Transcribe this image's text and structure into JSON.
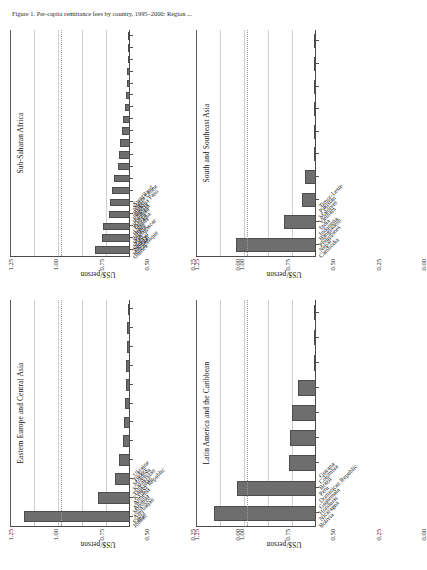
{
  "figure": {
    "caption": "Figure 1. Per-capita remittance fees by country, 1995–2000: Region ...",
    "axis_title": "US$/person",
    "tick_labels": [
      "1.25",
      "1.00",
      "0.75",
      "0.50",
      "0.25",
      "0.00"
    ],
    "bar_color": "#6e6e6e",
    "axis_color": "#4a4a4a",
    "gridline_color": "#cfcfcf",
    "reference_line_color": "#9a9a9a"
  },
  "chart_data": [
    {
      "type": "bar",
      "title": "Eastern Europe and Central Asia",
      "xlabel": "",
      "ylabel": "US$/person",
      "ylim": [
        0,
        1.25
      ],
      "yticks": [
        0.0,
        0.25,
        0.5,
        0.75,
        1.0,
        1.25
      ],
      "grid": true,
      "reference_line": 0.72,
      "categories": [
        "Jordan",
        "Egypt",
        "Azerbaijan",
        "Morocco",
        "Albania",
        "Armenia",
        "Kyrgyz Republic",
        "Tajikistan",
        "Kazakhstan",
        "Moldova",
        "Turkey",
        "Ukraine"
      ],
      "values": [
        1.1,
        0.33,
        0.16,
        0.115,
        0.075,
        0.065,
        0.055,
        0.045,
        0.04,
        0.035,
        0.03,
        0.01
      ]
    },
    {
      "type": "bar",
      "title": "Sub-Saharan Africa",
      "xlabel": "",
      "ylabel": "US$/person",
      "ylim": [
        0,
        1.25
      ],
      "yticks": [
        0.0,
        0.25,
        0.5,
        0.75,
        1.0,
        1.25
      ],
      "grid": true,
      "reference_line": 0.72,
      "categories": [
        "Guinea",
        "Mozambique",
        "Zambia",
        "Senegal",
        "Malawi",
        "Mali",
        "Madagascar",
        "Ghana",
        "Benin",
        "Uganda",
        "Tanzania",
        "Kenya",
        "Rwanda",
        "Ethiopia",
        "Nigeria",
        "Burkina Faso",
        "Niger",
        "Sierra Leone",
        "Swaziland"
      ],
      "values": [
        0.36,
        0.29,
        0.28,
        0.215,
        0.21,
        0.185,
        0.165,
        0.13,
        0.115,
        0.1,
        0.085,
        0.07,
        0.055,
        0.045,
        0.035,
        0.03,
        0.025,
        0.02,
        0.012
      ]
    },
    {
      "type": "bar",
      "title": "Latin America and the Caribbean",
      "xlabel": "",
      "ylabel": "US$/person",
      "ylim": [
        0,
        1.25
      ],
      "yticks": [
        0.0,
        0.25,
        0.5,
        0.75,
        1.0,
        1.25
      ],
      "grid": true,
      "reference_line": 0.72,
      "categories": [
        "Bolivia",
        "Nicaragua",
        "Honduras",
        "Guatemala",
        "Dominican Republic",
        "Peru",
        "Brazil",
        "Colombia",
        "Guyana"
      ],
      "values": [
        1.06,
        0.82,
        0.28,
        0.275,
        0.245,
        0.19,
        0.02,
        0.012,
        0.006
      ]
    },
    {
      "type": "bar",
      "title": "South and Southeast Asia",
      "xlabel": "",
      "ylabel": "US$/person",
      "ylim": [
        0,
        1.25
      ],
      "yticks": [
        0.0,
        0.25,
        0.5,
        0.75,
        1.0,
        1.25
      ],
      "grid": true,
      "reference_line": 0.72,
      "categories": [
        "Cambodia",
        "Nepal",
        "Philippines",
        "Bangladesh",
        "Indonesia",
        "India",
        "Vietnam",
        "Maldives",
        "Pakistan",
        "Timor-Leste"
      ],
      "values": [
        0.83,
        0.335,
        0.145,
        0.11,
        0.025,
        0.02,
        0.012,
        0.008,
        0.005,
        0.003
      ]
    }
  ]
}
